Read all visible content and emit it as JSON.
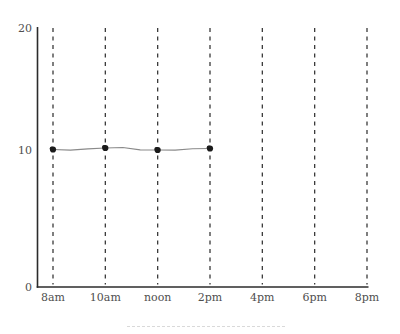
{
  "chart_data": {
    "type": "line",
    "title": "",
    "categories": [
      "8am",
      "10am",
      "noon",
      "2pm",
      "4pm",
      "6pm",
      "8pm"
    ],
    "values": [
      10,
      10,
      10,
      10,
      null,
      null,
      null
    ],
    "xlabel": "",
    "ylabel": "",
    "ylim": [
      0,
      20
    ],
    "ytick_labels": [
      "0",
      "10",
      "20"
    ],
    "ytick_values": [
      0,
      10,
      20
    ],
    "grid": "vertical dashed gridline at every x tick",
    "legend": "none",
    "style": "hand-drawn wavy line, flat at y=10 from 8am through 2pm, no data after 2pm",
    "colors": {
      "background": "#ffffff",
      "axis": "#2b2b2b",
      "gridline": "#3a3a3a",
      "tick_label": "#4f4f4f",
      "line": "#8a8a8a",
      "marker": "#1b1b1b",
      "footer_rule": "#d9d9d9"
    }
  }
}
